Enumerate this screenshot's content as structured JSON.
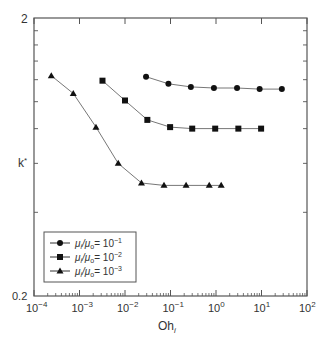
{
  "chart_data": {
    "type": "line",
    "title": "",
    "xlabel": "Oh",
    "xlabel_subscript": "i",
    "ylabel": "k*",
    "xscale": "log",
    "yscale": "log",
    "xlim": [
      0.0001,
      100
    ],
    "ylim": [
      0.2,
      2
    ],
    "x_ticks": [
      {
        "base": "10",
        "exp": "-4"
      },
      {
        "base": "10",
        "exp": "-3"
      },
      {
        "base": "10",
        "exp": "-2"
      },
      {
        "base": "10",
        "exp": "-1"
      },
      {
        "base": "10",
        "exp": "0"
      },
      {
        "base": "10",
        "exp": "1"
      },
      {
        "base": "10",
        "exp": "2"
      }
    ],
    "y_tick_labels": [
      "2",
      "0.2"
    ],
    "y_minor_ticks": [
      0.4,
      0.6,
      0.8,
      1.0,
      1.2,
      1.4,
      1.6,
      1.8
    ],
    "grid": false,
    "legend_position": "lower left",
    "series": [
      {
        "name": "μi/μo = 10^-1",
        "legend_ratio": "μ",
        "legend_exp": "-1",
        "marker": "circle",
        "x": [
          0.029,
          0.09,
          0.28,
          0.9,
          2.9,
          9.1,
          28
        ],
        "y": [
          1.23,
          1.16,
          1.13,
          1.12,
          1.12,
          1.11,
          1.11
        ]
      },
      {
        "name": "μi/μo = 10^-2",
        "legend_exp": "-2",
        "marker": "square",
        "x": [
          0.0032,
          0.01,
          0.031,
          0.098,
          0.3,
          0.96,
          3.1,
          9.8
        ],
        "y": [
          1.19,
          1.01,
          0.86,
          0.81,
          0.8,
          0.8,
          0.8,
          0.8
        ]
      },
      {
        "name": "μi/μo = 10^-3",
        "legend_exp": "-3",
        "marker": "triangle",
        "x": [
          0.00024,
          0.00073,
          0.0023,
          0.0071,
          0.023,
          0.072,
          0.22,
          0.71,
          1.3
        ],
        "y": [
          1.24,
          1.07,
          0.81,
          0.6,
          0.51,
          0.5,
          0.5,
          0.5,
          0.5
        ]
      }
    ]
  },
  "legend": {
    "items": [
      {
        "label_prefix": "μ",
        "sub1": "i",
        "mid": "/μ",
        "sub2": "o",
        "eq": "= 10",
        "exp": "−1"
      },
      {
        "label_prefix": "μ",
        "sub1": "i",
        "mid": "/μ",
        "sub2": "o",
        "eq": "= 10",
        "exp": "−2"
      },
      {
        "label_prefix": "μ",
        "sub1": "i",
        "mid": "/μ",
        "sub2": "o",
        "eq": "= 10",
        "exp": "−3"
      }
    ]
  },
  "colors": {
    "axis": "#555555",
    "line": "#777777",
    "marker": "#111111",
    "text": "#333333"
  }
}
